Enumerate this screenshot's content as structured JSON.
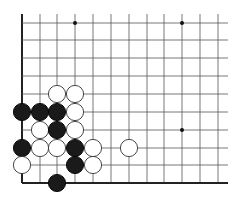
{
  "board": {
    "description": "Go board corner fragment (lower-left corner)",
    "columns_x": [
      22,
      40,
      57,
      75,
      93,
      111,
      129,
      147,
      164,
      182,
      200,
      218
    ],
    "rows_y": [
      23,
      40,
      58,
      76,
      94,
      112,
      130,
      148,
      165,
      183
    ],
    "line_extent": {
      "right": 228,
      "top": 14
    },
    "edges": [
      "left",
      "bottom"
    ],
    "line_color": "#555555",
    "edge_color": "#222222",
    "star_points": [
      [
        3,
        0
      ],
      [
        9,
        0
      ],
      [
        9,
        6
      ]
    ],
    "stones": [
      {
        "color": "white",
        "col": 2,
        "row": 4
      },
      {
        "color": "white",
        "col": 3,
        "row": 4
      },
      {
        "color": "black",
        "col": 0,
        "row": 5
      },
      {
        "color": "black",
        "col": 1,
        "row": 5
      },
      {
        "color": "black",
        "col": 2,
        "row": 5
      },
      {
        "color": "white",
        "col": 3,
        "row": 5
      },
      {
        "color": "white",
        "col": 1,
        "row": 6
      },
      {
        "color": "black",
        "col": 2,
        "row": 6
      },
      {
        "color": "white",
        "col": 3,
        "row": 6
      },
      {
        "color": "black",
        "col": 0,
        "row": 7
      },
      {
        "color": "white",
        "col": 1,
        "row": 7
      },
      {
        "color": "white",
        "col": 2,
        "row": 7
      },
      {
        "color": "black",
        "col": 3,
        "row": 7
      },
      {
        "color": "white",
        "col": 4,
        "row": 7
      },
      {
        "color": "white",
        "col": 6,
        "row": 7
      },
      {
        "color": "white",
        "col": 0,
        "row": 8
      },
      {
        "color": "black",
        "col": 3,
        "row": 8
      },
      {
        "color": "white",
        "col": 4,
        "row": 8
      },
      {
        "color": "black",
        "col": 2,
        "row": 9
      }
    ],
    "stone_radius": 8.6
  }
}
